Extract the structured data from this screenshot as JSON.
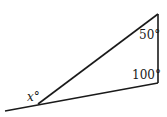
{
  "diagram": {
    "type": "triangle-with-exterior-angle",
    "vertices": {
      "top": [
        158,
        14
      ],
      "bottom_right": [
        158,
        83
      ],
      "left": [
        38,
        104
      ]
    },
    "extension_end": [
      5,
      111
    ],
    "labels": {
      "top_angle": "50°",
      "bottom_right_angle": "100°",
      "exterior_angle": "x°"
    },
    "line_color": "#1a1a1a"
  }
}
